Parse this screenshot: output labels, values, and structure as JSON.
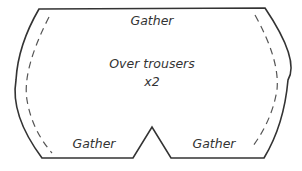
{
  "diagram": {
    "type": "sewing-pattern-piece",
    "piece_name": "Over trousers",
    "quantity": "x2",
    "labels": {
      "top": "Gather",
      "bottom_left": "Gather",
      "bottom_right": "Gather"
    },
    "style": {
      "outline_color": "#333333",
      "seam_color": "#555555",
      "text_color": "#333333",
      "background": "#ffffff"
    },
    "features": {
      "outline": "solid cut line",
      "seam_allowance": "dashed lines along curved sides",
      "notch": "triangular V notch at bottom center"
    }
  }
}
